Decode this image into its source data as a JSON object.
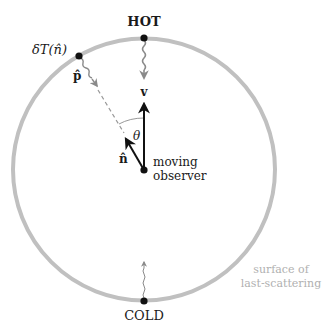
{
  "diagram": {
    "title_hot": "HOT",
    "title_cold": "COLD",
    "delta_t_label": "δT(n̂)",
    "p_hat_label": "p̂",
    "v_label": "v",
    "n_hat_label": "n̂",
    "theta_label": "θ",
    "observer_label_line1": "moving",
    "observer_label_line2": "observer",
    "surface_label_line1": "surface of",
    "surface_label_line2": "last-scattering",
    "colors": {
      "circle": "#c0c0c0",
      "arrow": "#111111",
      "photon": "#8a8a8a",
      "surface_text": "#b0b0b0"
    }
  }
}
